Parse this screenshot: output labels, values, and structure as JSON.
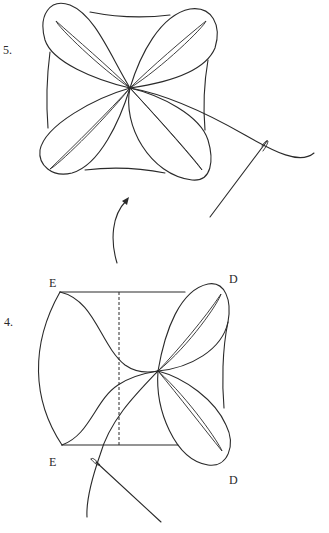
{
  "figure": {
    "steps": [
      {
        "number_label": "5.",
        "description": "Square with four petal folds meeting at center, thread drawn out with needle"
      },
      {
        "number_label": "4.",
        "description": "Square with two petals folded on right side, dashed fold line, corners labeled E and D, needle and thread at bottom"
      }
    ],
    "corner_labels": {
      "top_left": "E",
      "bottom_left": "E",
      "top_right": "D",
      "bottom_right": "D"
    },
    "arrow": {
      "direction": "from step 4 up to step 5"
    }
  }
}
